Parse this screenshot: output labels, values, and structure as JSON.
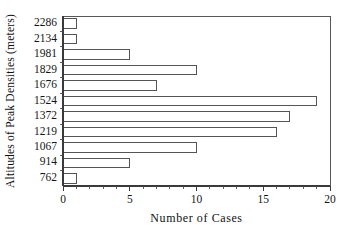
{
  "chart_data": {
    "type": "bar",
    "orientation": "horizontal",
    "title": "",
    "xlabel": "Number of Cases",
    "ylabel": "Altitudes of Peak Densities (meters)",
    "categories": [
      "2286",
      "2134",
      "1981",
      "1829",
      "1676",
      "1524",
      "1372",
      "1219",
      "1067",
      "914",
      "762"
    ],
    "values": [
      1,
      1,
      5,
      10,
      7,
      19,
      17,
      16,
      10,
      5,
      1
    ],
    "xlim": [
      0,
      20
    ],
    "xticks": [
      0,
      5,
      10,
      15,
      20
    ],
    "xtick_labels": [
      "0",
      "5",
      "10",
      "15",
      "20"
    ],
    "xtick_minor_step": 1,
    "grid": false,
    "legend": null,
    "bar_fill_color": "#ffffff",
    "bar_edge_color": "#555555",
    "axis_color": "#3a3a3a",
    "frame_color": "#585858",
    "background_color": "#ffffff"
  }
}
